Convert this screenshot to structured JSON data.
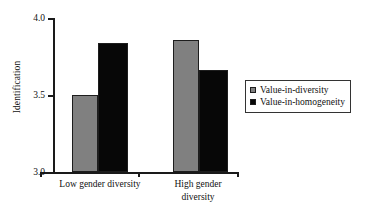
{
  "chart_data": {
    "type": "bar",
    "title": "",
    "xlabel": "",
    "ylabel": "Identification",
    "categories": [
      "Low gender diversity",
      "High gender diversity"
    ],
    "category_lines": [
      [
        "Low gender diversity"
      ],
      [
        "High gender",
        "diversity"
      ]
    ],
    "series": [
      {
        "name": "Value-in-diversity",
        "color": "#808080",
        "values": [
          3.5,
          3.86
        ]
      },
      {
        "name": "Value-in-homogeneity",
        "color": "#070707",
        "values": [
          3.84,
          3.66
        ]
      }
    ],
    "ylim": [
      3.0,
      4.0
    ],
    "yticks": [
      "3.0",
      "3.5",
      "4.0"
    ],
    "ytick_values": [
      3.0,
      3.5,
      4.0
    ],
    "grid": false,
    "legend_position": "right"
  },
  "axis": {
    "y_label": "Identification",
    "ytick_0": "3.0",
    "ytick_1": "3.5",
    "ytick_2": "4.0"
  },
  "categories": {
    "cat0_line0": "Low gender diversity",
    "cat1_line0": "High gender",
    "cat1_line1": "diversity"
  },
  "legend": {
    "entry0": "Value-in-diversity",
    "entry1": "Value-in-homogeneity"
  }
}
